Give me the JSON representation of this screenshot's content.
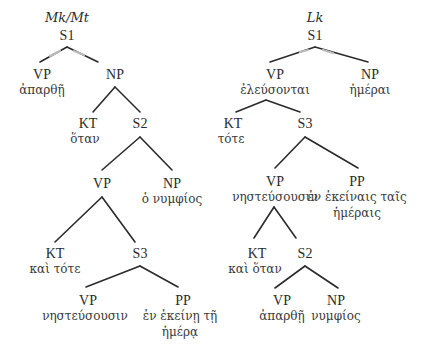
{
  "diagram": {
    "type": "syntax-tree-comparison",
    "trees": [
      {
        "title": "Mk/Mt",
        "root": "S1",
        "nodes": {
          "vp1": {
            "cat": "VP",
            "word": "ἀπαρθῇ"
          },
          "np1": {
            "cat": "NP"
          },
          "kt1": {
            "cat": "KT",
            "word": "ὅταν"
          },
          "s2": {
            "cat": "S2"
          },
          "vp2": {
            "cat": "VP"
          },
          "np2": {
            "cat": "NP",
            "word": "ὁ νυμφίος"
          },
          "kt2": {
            "cat": "KT",
            "word": "καὶ τότε"
          },
          "s3": {
            "cat": "S3"
          },
          "vp3": {
            "cat": "VP",
            "word": "νηστεύσουσιν"
          },
          "pp": {
            "cat": "PP",
            "word_line1": "ἐν ἐκείνῃ τῇ",
            "word_line2": "ἡμέρᾳ"
          }
        }
      },
      {
        "title": "Lk",
        "root": "S1",
        "nodes": {
          "vp1": {
            "cat": "VP",
            "word": "ἐλεύσονται"
          },
          "np1": {
            "cat": "NP",
            "word": "ἡμέραι"
          },
          "kt1": {
            "cat": "KT",
            "word": "τότε"
          },
          "s3": {
            "cat": "S3"
          },
          "vp2": {
            "cat": "VP",
            "word": "νηστεύσουσιν"
          },
          "pp": {
            "cat": "PP",
            "word_line1": "ἐν ἐκείναις ταῖς",
            "word_line2": "ἡμέραις"
          },
          "kt2": {
            "cat": "KT",
            "word": "καὶ ὅταν"
          },
          "s2": {
            "cat": "S2"
          },
          "vp3": {
            "cat": "VP",
            "word": "ἀπαρθῇ"
          },
          "np2": {
            "cat": "NP",
            "word": "νυμφίος"
          }
        }
      }
    ]
  }
}
